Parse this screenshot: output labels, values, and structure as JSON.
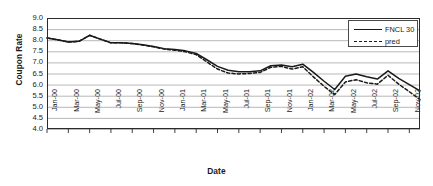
{
  "chart_data": {
    "type": "line",
    "title": "",
    "xlabel": "Date",
    "ylabel": "Coupon Rate",
    "ylim": [
      4.0,
      9.0
    ],
    "ytick_labels": [
      "9.0",
      "8.5",
      "8.0",
      "7.5",
      "7.0",
      "6.5",
      "6.0",
      "5.5",
      "5.0",
      "4.5",
      "4.0"
    ],
    "ytick_values": [
      9.0,
      8.5,
      8.0,
      7.5,
      7.0,
      6.5,
      6.0,
      5.5,
      5.0,
      4.5,
      4.0
    ],
    "grid": true,
    "grid_axis": "y",
    "legend_position": "top-right",
    "x": [
      "Jan-00",
      "Feb-00",
      "Mar-00",
      "Apr-00",
      "May-00",
      "Jun-00",
      "Jul-00",
      "Aug-00",
      "Sep-00",
      "Oct-00",
      "Nov-00",
      "Dec-00",
      "Jan-01",
      "Feb-01",
      "Mar-01",
      "Apr-01",
      "May-01",
      "Jun-01",
      "Jul-01",
      "Aug-01",
      "Sep-01",
      "Oct-01",
      "Nov-01",
      "Dec-01",
      "Jan-02",
      "Feb-02",
      "Mar-02",
      "Apr-02",
      "May-02",
      "Jun-02",
      "Jul-02",
      "Aug-02",
      "Sep-02",
      "Oct-02",
      "Nov-02",
      "Dec-02"
    ],
    "xtick_labels": [
      "Jan-00",
      "Mar-00",
      "May-00",
      "Jul-00",
      "Sep-00",
      "Nov-00",
      "Jan-01",
      "Mar-01",
      "May-01",
      "Jul-01",
      "Sep-01",
      "Nov-01",
      "Jan-02",
      "Mar-02",
      "May-02",
      "Jul-02",
      "Sep-02",
      "Nov-02"
    ],
    "xtick_index": [
      0,
      2,
      4,
      6,
      8,
      10,
      12,
      14,
      16,
      18,
      20,
      22,
      24,
      26,
      28,
      30,
      32,
      34
    ],
    "series": [
      {
        "name": "FNCL 30",
        "style": "solid",
        "color": "#1a1a1a",
        "values": [
          8.1,
          8.02,
          7.92,
          7.95,
          8.22,
          8.05,
          7.88,
          7.88,
          7.85,
          7.8,
          7.72,
          7.62,
          7.58,
          7.52,
          7.4,
          7.12,
          6.82,
          6.65,
          6.58,
          6.58,
          6.62,
          6.85,
          6.88,
          6.8,
          6.92,
          6.55,
          6.15,
          5.78,
          6.38,
          6.48,
          6.35,
          6.25,
          6.62,
          6.28,
          6.0,
          5.72
        ]
      },
      {
        "name": "pred",
        "style": "dashed",
        "color": "#1a1a1a",
        "values": [
          8.1,
          8.02,
          7.92,
          7.95,
          8.22,
          8.05,
          7.88,
          7.88,
          7.85,
          7.78,
          7.7,
          7.6,
          7.55,
          7.48,
          7.35,
          7.02,
          6.7,
          6.52,
          6.48,
          6.5,
          6.55,
          6.78,
          6.82,
          6.7,
          6.8,
          6.35,
          5.92,
          5.55,
          6.12,
          6.22,
          6.08,
          6.02,
          6.42,
          6.02,
          5.68,
          5.32
        ]
      }
    ]
  },
  "legend": {
    "items": [
      {
        "label": "FNCL 30",
        "style": "solid"
      },
      {
        "label": "pred",
        "style": "dashed"
      }
    ]
  }
}
